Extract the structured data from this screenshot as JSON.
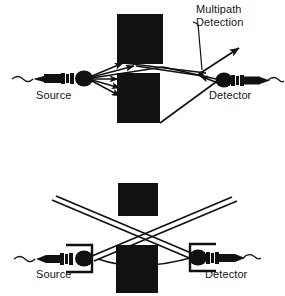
{
  "figure": {
    "background_color": "#ffffff",
    "ink_color": "#111111",
    "barrier_color": "#111111",
    "panels": [
      {
        "id": "top-panel",
        "name": "multipath-detection-panel",
        "labels": {
          "source": "Source",
          "detector": "Detector",
          "callout_line1": "Multipath",
          "callout_line2": "Detection"
        },
        "barriers": [
          {
            "name": "upper-barrier",
            "x": 117,
            "y": 14,
            "width": 46,
            "height": 50
          },
          {
            "name": "lower-barrier",
            "x": 117,
            "y": 73,
            "width": 43,
            "height": 50
          }
        ],
        "source_position": {
          "x": 78,
          "y": 78
        },
        "detector_position": {
          "x": 228,
          "y": 80
        },
        "ray_count": 7
      },
      {
        "id": "bottom-panel",
        "name": "crossed-path-panel",
        "labels": {
          "source": "Source",
          "detector": "Detector"
        },
        "barriers": [
          {
            "name": "upper-barrier",
            "x": 118,
            "y": 183,
            "width": 40,
            "height": 33
          },
          {
            "name": "lower-barrier",
            "x": 116,
            "y": 245,
            "width": 42,
            "height": 48
          }
        ],
        "source_position": {
          "x": 84,
          "y": 258
        },
        "detector_position": {
          "x": 202,
          "y": 257
        },
        "ray_count": 4
      }
    ]
  },
  "icons": {
    "transducer": "transducer-icon",
    "cable": "cable-icon",
    "arrowhead": "arrowhead-icon",
    "leader_line": "leader-line-icon",
    "barrier": "barrier-block-icon"
  }
}
